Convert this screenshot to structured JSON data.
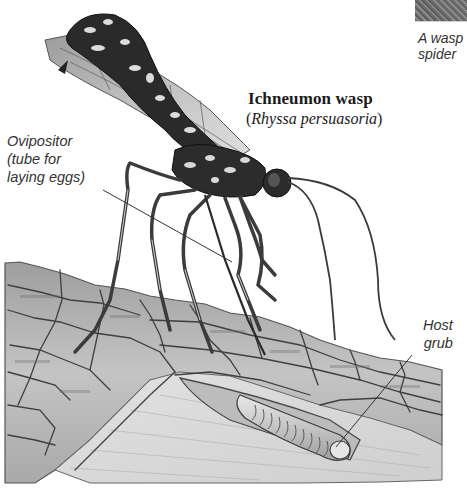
{
  "figure": {
    "title": "Ichneumon wasp",
    "scientific_name_open": "(",
    "scientific_name": "Rhyssa persuasoria",
    "scientific_name_close": ")",
    "side_caption": {
      "line1": "A wasp",
      "line2": "spider"
    },
    "labels": {
      "ovipositor": {
        "line1": "Ovipositor",
        "line2": "(tube for",
        "line3": "laying eggs)"
      },
      "host_grub": {
        "line1": "Host",
        "line2": "grub"
      }
    },
    "colors": {
      "background": "#ffffff",
      "ink": "#1a1a1a",
      "label_text": "#333333",
      "wood_light": "#d8d8d8",
      "wood_mid": "#a8a8a8",
      "wood_dark": "#555555",
      "wing": "#9a9a9a"
    }
  }
}
